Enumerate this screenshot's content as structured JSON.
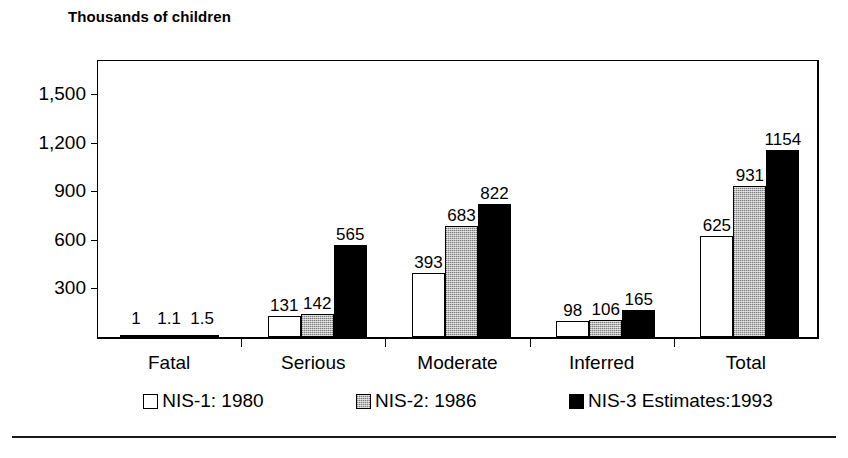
{
  "chart_data": {
    "type": "bar",
    "title": "Thousands of children",
    "xlabel": "",
    "ylabel": "Thousands of children",
    "categories": [
      "Fatal",
      "Serious",
      "Moderate",
      "Inferred",
      "Total"
    ],
    "series": [
      {
        "name": "NIS-1: 1980",
        "swatch": "white",
        "values": [
          1,
          131,
          393,
          98,
          625
        ]
      },
      {
        "name": "NIS-2: 1986",
        "swatch": "gray-hatch",
        "values": [
          1.1,
          142,
          683,
          106,
          931
        ]
      },
      {
        "name": "NIS-3 Estimates:1993",
        "swatch": "black",
        "values": [
          1.5,
          565,
          822,
          165,
          1154
        ]
      }
    ],
    "value_labels": [
      [
        "1",
        "1.1",
        "1.5"
      ],
      [
        "131",
        "142",
        "565"
      ],
      [
        "393",
        "683",
        "822"
      ],
      [
        "98",
        "106",
        "165"
      ],
      [
        "625",
        "931",
        "1154"
      ]
    ],
    "yticks": [
      300,
      600,
      900,
      1200,
      1500
    ],
    "ytick_labels": [
      "300",
      "600",
      "900",
      "1,200",
      "1,500"
    ],
    "ylim": [
      0,
      1650
    ],
    "grid": false,
    "legend_position": "bottom"
  },
  "legend": {
    "items": [
      {
        "label": "NIS-1: 1980",
        "style": "s1"
      },
      {
        "label": "NIS-2: 1986",
        "style": "s2"
      },
      {
        "label": "NIS-3 Estimates:1993",
        "style": "s3"
      }
    ]
  }
}
